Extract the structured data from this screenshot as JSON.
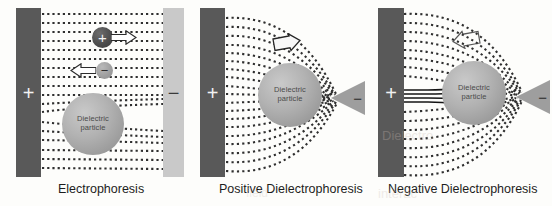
{
  "figure": {
    "background_color": "#fdfdfb",
    "panel_count": 3
  },
  "colors": {
    "electrode_dark": "#595959",
    "electrode_light": "#c9c9c9",
    "particle_gray": "#b2b2b2",
    "field_line_dark": "#2f2f2f",
    "tip_electrode": "#9e9e9e",
    "caption_text": "#1d1d1d"
  },
  "panels": [
    {
      "id": "electrophoresis",
      "caption": "Electrophoresis",
      "electrodes": [
        {
          "name": "left-electrode",
          "polarity": "+",
          "shape": "plate",
          "fill": "dark"
        },
        {
          "name": "right-electrode",
          "polarity": "−",
          "shape": "plate",
          "fill": "light"
        }
      ],
      "field": {
        "type": "uniform",
        "style": "dotted-lines",
        "line_count": 17,
        "direction": "horizontal"
      },
      "particles": [
        {
          "name": "positive-charge",
          "label": "+",
          "fill": "dark",
          "motion": "right"
        },
        {
          "name": "negative-charge",
          "label": "−",
          "fill": "light",
          "motion": "left"
        },
        {
          "name": "dielectric-particle",
          "label_line1": "Dielectric",
          "label_line2": "particle",
          "motion": "none"
        }
      ],
      "arrows": [
        {
          "name": "positive-charge-motion-arrow",
          "direction": "right"
        },
        {
          "name": "negative-charge-motion-arrow",
          "direction": "left"
        }
      ]
    },
    {
      "id": "positive-dielectrophoresis",
      "caption": "Positive Dielectrophoresis",
      "electrodes": [
        {
          "name": "left-electrode",
          "polarity": "+",
          "shape": "plate",
          "fill": "dark"
        },
        {
          "name": "right-electrode",
          "polarity": "−",
          "shape": "pointed-tip",
          "fill": "light"
        }
      ],
      "field": {
        "type": "non-uniform",
        "style": "dotted-lines",
        "line_count": 17,
        "direction": "converging-to-tip"
      },
      "particles": [
        {
          "name": "dielectric-particle",
          "label_line1": "Dielectric",
          "label_line2": "particle",
          "motion": "toward-high-field"
        }
      ],
      "arrows": [
        {
          "name": "particle-motion-arrow",
          "direction": "right-toward-tip"
        }
      ]
    },
    {
      "id": "negative-dielectrophoresis",
      "caption": "Negative Dielectrophoresis",
      "electrodes": [
        {
          "name": "left-electrode",
          "polarity": "+",
          "shape": "plate",
          "fill": "dark"
        },
        {
          "name": "right-electrode",
          "polarity": "−",
          "shape": "pointed-tip",
          "fill": "light"
        }
      ],
      "field": {
        "type": "non-uniform",
        "style": "dotted-lines-with-solid-deflection",
        "line_count": 17,
        "direction": "deflected-around-particle"
      },
      "particles": [
        {
          "name": "dielectric-particle",
          "label_line1": "Dielectric",
          "label_line2": "particle",
          "motion": "toward-low-field"
        }
      ],
      "arrows": [
        {
          "name": "particle-motion-arrow",
          "direction": "left-away-from-tip"
        }
      ]
    }
  ],
  "particle_label": {
    "line1": "Dielectric",
    "line2": "particle"
  },
  "signs": {
    "positive": "+",
    "negative": "−"
  },
  "artifacts": {
    "bleed_1": "Dielectro",
    "bleed_2": "interac",
    "bleed_3": "field"
  }
}
